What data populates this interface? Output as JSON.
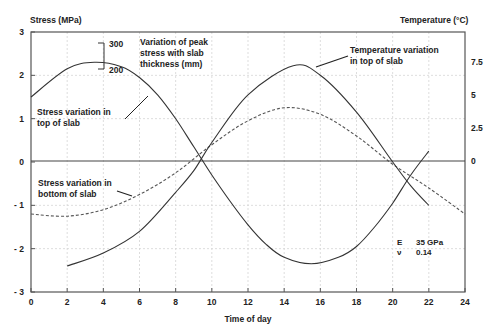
{
  "chart_data": {
    "type": "line",
    "title": "",
    "xlabel": "Time of day",
    "ylabel": "Stress (MPa)",
    "y2label": "Temperature (°C)",
    "xlim": [
      0,
      24
    ],
    "ylim": [
      -3,
      3
    ],
    "y2lim": [
      -10,
      10
    ],
    "grid": true,
    "x_ticks": [
      "0",
      "2",
      "4",
      "6",
      "8",
      "10",
      "12",
      "14",
      "16",
      "18",
      "20",
      "22",
      "24"
    ],
    "y_ticks": [
      "3",
      "2",
      "1",
      "0",
      "-1",
      "-2",
      "-3"
    ],
    "y2_ticks": [
      "7.5",
      "5",
      "2.5",
      "0"
    ],
    "series": [
      {
        "name": "Stress variation in top of slab",
        "style": "solid",
        "x": [
          0,
          2,
          3.5,
          5,
          6,
          7,
          8,
          9,
          10,
          11,
          12,
          13,
          14,
          15.5,
          17,
          18,
          19,
          20,
          21,
          22
        ],
        "values": [
          1.5,
          2.15,
          2.3,
          2.2,
          1.95,
          1.55,
          1.0,
          0.35,
          -0.3,
          -0.9,
          -1.45,
          -1.9,
          -2.2,
          -2.35,
          -2.2,
          -1.95,
          -1.5,
          -0.95,
          -0.3,
          0.25
        ]
      },
      {
        "name": "Stress variation in bottom of slab",
        "style": "dashed",
        "x": [
          0,
          2,
          4,
          6,
          8,
          10,
          12,
          14,
          16,
          18,
          20,
          22,
          24
        ],
        "values": [
          -1.2,
          -1.25,
          -1.1,
          -0.75,
          -0.25,
          0.4,
          0.95,
          1.25,
          1.1,
          0.6,
          -0.05,
          -0.6,
          -1.2
        ]
      },
      {
        "name": "Temperature variation in top of slab",
        "style": "solid",
        "x": [
          2,
          4,
          6,
          8,
          9,
          10,
          12,
          14.5,
          16,
          18,
          20,
          21,
          22
        ],
        "values": [
          -2.4,
          -2.1,
          -1.6,
          -0.7,
          -0.2,
          0.45,
          1.55,
          2.22,
          2.0,
          1.15,
          0.0,
          -0.55,
          -1.0
        ]
      }
    ],
    "annotations": [
      {
        "text": "Variation of peak stress with slab thickness (mm)",
        "lines": [
          "Variation of peak",
          "stress with slab",
          "thickness (mm)"
        ]
      },
      {
        "text": "300"
      },
      {
        "text": "200"
      },
      {
        "text": "Stress variation in top of slab",
        "lines": [
          "Stress variation in",
          "top of slab"
        ]
      },
      {
        "text": "Stress variation in bottom of slab",
        "lines": [
          "Stress variation in",
          "bottom of slab"
        ]
      },
      {
        "text": "Temperature variation in top of slab",
        "lines": [
          "Temperature variation",
          "in top of slab"
        ]
      },
      {
        "text": "E 35 GPa"
      },
      {
        "text": "ν 0.14"
      }
    ],
    "legend": null
  },
  "labels": {
    "ylabel": "Stress (MPa)",
    "y2label": "Temperature (°C)",
    "xlabel": "Time of day",
    "peak_note": [
      "Variation of peak",
      "stress with slab",
      "thickness (mm)"
    ],
    "bracket_top": "300",
    "bracket_bottom": "200",
    "top_note": [
      "Stress variation in",
      "top of slab"
    ],
    "bottom_note": [
      "Stress variation in",
      "bottom of slab"
    ],
    "temp_note": [
      "Temperature variation",
      "in top of slab"
    ],
    "e_symbol": "E",
    "e_value": "35 GPa",
    "nu_symbol": "ν",
    "nu_value": "0.14"
  }
}
